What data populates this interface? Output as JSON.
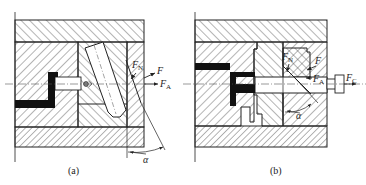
{
  "figure": {
    "colors": {
      "line": "#222222",
      "hatch": "#444444",
      "solid_part": "#111111",
      "background": "#ffffff"
    },
    "panels": [
      {
        "id": "a",
        "caption": "(a)",
        "mechanism": "angled pin side core pulling",
        "labels": {
          "normal_force": {
            "main": "F",
            "sub": "N"
          },
          "resultant_force": {
            "main": "F",
            "sub": ""
          },
          "axial_force": {
            "main": "F",
            "sub": "A"
          },
          "angle": "α"
        }
      },
      {
        "id": "b",
        "caption": "(b)",
        "mechanism": "wedge-locked core with external pulling force",
        "labels": {
          "normal_force": {
            "main": "F",
            "sub": "N"
          },
          "resultant_force": {
            "main": "F",
            "sub": ""
          },
          "axial_force": {
            "main": "F",
            "sub": "A"
          },
          "pulling_force": {
            "main": "F",
            "sub": "C"
          },
          "angle": "α"
        }
      }
    ]
  }
}
